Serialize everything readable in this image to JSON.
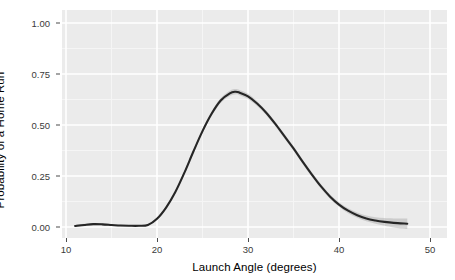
{
  "chart_data": {
    "type": "line",
    "title": "",
    "subtitle": "",
    "xlabel": "Launch Angle (degrees)",
    "ylabel": "Probability of a Home Run",
    "xlim": [
      8.5,
      51.0
    ],
    "ylim": [
      -0.05,
      1.06
    ],
    "xticks": [
      10,
      20,
      30,
      40,
      50
    ],
    "xticklabels": [
      "10",
      "20",
      "30",
      "40",
      "50"
    ],
    "yticks": [
      0.0,
      0.25,
      0.5,
      0.75,
      1.0
    ],
    "yticklabels": [
      "0.00",
      "0.25",
      "0.50",
      "0.75",
      "1.00"
    ],
    "x_minor_ticks": [
      15,
      25,
      35,
      45
    ],
    "y_minor_ticks": [
      0.125,
      0.375,
      0.625,
      0.875
    ],
    "grid": true,
    "grid_major_color": "#ffffff",
    "grid_minor_color": "#f5f5f5",
    "panel_background": "#ebebeb",
    "legend": "none",
    "legend_position": "none",
    "series": [
      {
        "name": "Probability of a Home Run",
        "type": "smooth",
        "line_color": "#262626",
        "band_color": "#9a9a9a",
        "band_opacity": 0.38,
        "x": [
          11.0,
          12.0,
          13.0,
          14.0,
          15.0,
          16.0,
          17.0,
          18.0,
          19.0,
          20.0,
          21.0,
          22.0,
          23.0,
          24.0,
          25.0,
          26.0,
          27.0,
          28.0,
          28.6,
          29.0,
          30.0,
          31.0,
          32.0,
          33.0,
          34.0,
          35.0,
          36.0,
          37.0,
          38.0,
          39.0,
          40.0,
          41.0,
          42.0,
          43.0,
          44.0,
          45.0,
          46.0,
          47.5
        ],
        "y": [
          0.005,
          0.01,
          0.014,
          0.013,
          0.01,
          0.007,
          0.006,
          0.006,
          0.01,
          0.04,
          0.095,
          0.17,
          0.265,
          0.37,
          0.47,
          0.555,
          0.62,
          0.655,
          0.663,
          0.66,
          0.64,
          0.605,
          0.56,
          0.505,
          0.445,
          0.385,
          0.32,
          0.258,
          0.2,
          0.15,
          0.11,
          0.08,
          0.058,
          0.042,
          0.032,
          0.025,
          0.02,
          0.016
        ],
        "y_lower": [
          0.0,
          0.004,
          0.008,
          0.007,
          0.005,
          0.003,
          0.003,
          0.003,
          0.007,
          0.035,
          0.089,
          0.163,
          0.257,
          0.361,
          0.46,
          0.544,
          0.608,
          0.642,
          0.65,
          0.647,
          0.627,
          0.593,
          0.549,
          0.494,
          0.434,
          0.374,
          0.309,
          0.247,
          0.189,
          0.139,
          0.099,
          0.068,
          0.045,
          0.028,
          0.016,
          0.006,
          -0.002,
          -0.01
        ],
        "y_upper": [
          0.011,
          0.016,
          0.02,
          0.019,
          0.015,
          0.011,
          0.009,
          0.009,
          0.013,
          0.045,
          0.101,
          0.177,
          0.273,
          0.379,
          0.48,
          0.566,
          0.632,
          0.668,
          0.676,
          0.673,
          0.653,
          0.617,
          0.571,
          0.516,
          0.456,
          0.396,
          0.331,
          0.269,
          0.211,
          0.161,
          0.121,
          0.092,
          0.071,
          0.056,
          0.048,
          0.044,
          0.042,
          0.042
        ]
      }
    ]
  },
  "axes": {
    "y_title": "Probability of a Home Run",
    "x_title": "Launch Angle (degrees)",
    "y_tick_labels": [
      "1.00",
      "0.75",
      "0.50",
      "0.25",
      "0.00"
    ],
    "x_tick_labels": [
      "10",
      "20",
      "30",
      "40",
      "50"
    ]
  }
}
